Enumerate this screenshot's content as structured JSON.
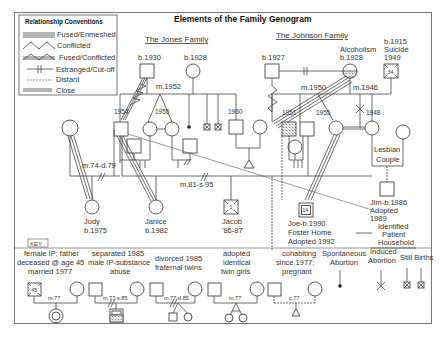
{
  "title": "Elements of the Family Genogram",
  "legend": {
    "title": "Relationship Conventions",
    "items": [
      {
        "label": "Fused/Enmeshed",
        "style": "triple-line"
      },
      {
        "label": "Conflicted",
        "style": "zigzag"
      },
      {
        "label": "Fused/Conflicted",
        "style": "zigzag-over-lines"
      },
      {
        "label": "Estranged/Cut-off",
        "style": "line-with-bars"
      },
      {
        "label": "Distant",
        "style": "dashed-line"
      },
      {
        "label": "Close",
        "style": "double-line"
      }
    ]
  },
  "families": {
    "jones": {
      "label": "The Jones Family",
      "father": "b.1930",
      "mother": "b.1928",
      "marriage": "m.1952",
      "son_birth": "1954",
      "twins_birth": "1955",
      "son2_birth": "1960"
    },
    "johnson": {
      "label": "The Johnson Family",
      "father": "b.1927",
      "mother_note": "Alcoholism",
      "mother": "b.1928",
      "marriage": "m.1950",
      "second_marriage": "m.1946",
      "husband2": [
        "b.1915",
        "Suicide",
        "1949"
      ],
      "husband2_age": "34",
      "son_birth": "1951",
      "daughter_birth": "1955",
      "daughter2_birth": "1948"
    }
  },
  "marriages": {
    "judy_parents": "m.74-d.79",
    "janice_parents": "m.81-s.95"
  },
  "lesbian_couple": "Lesbian Couple",
  "children": {
    "judy": [
      "Judy",
      "b.1975"
    ],
    "janice": [
      "Janice",
      "b.1982"
    ],
    "jacob": [
      "Jacob",
      "'86-87"
    ],
    "jacob_age": "1",
    "joe": [
      "Joe-b.1990",
      "Foster Home",
      "Adopted 1992"
    ],
    "joe_age": "14",
    "jim": [
      "Jim-b.1986",
      "Adopted",
      "1989"
    ]
  },
  "identified_patient": [
    "Identified",
    "Patient",
    "Household"
  ],
  "key": {
    "label": "KEY",
    "items": [
      {
        "text": [
          "female IP; father",
          "deceased @ age 45",
          "married 1977"
        ],
        "union": "m.77",
        "age": "45"
      },
      {
        "text": [
          "separated 1985",
          "male IP-substance",
          "abuse"
        ],
        "union": "m.77-s.85"
      },
      {
        "text": [
          "divorced 1985",
          "fraternal twins"
        ],
        "union": "m.77-d.85"
      },
      {
        "text": [
          "adopted",
          "identical",
          "twin girls"
        ],
        "union": "m.77"
      },
      {
        "text": [
          "cohabiting",
          "since 1977;",
          "pregnant"
        ],
        "union": "c.77"
      },
      {
        "text": [
          "Spontaneous",
          "Abortion"
        ]
      },
      {
        "text": [
          "Induced",
          "Abortion"
        ]
      },
      {
        "text": [
          "Still Births"
        ]
      }
    ]
  }
}
